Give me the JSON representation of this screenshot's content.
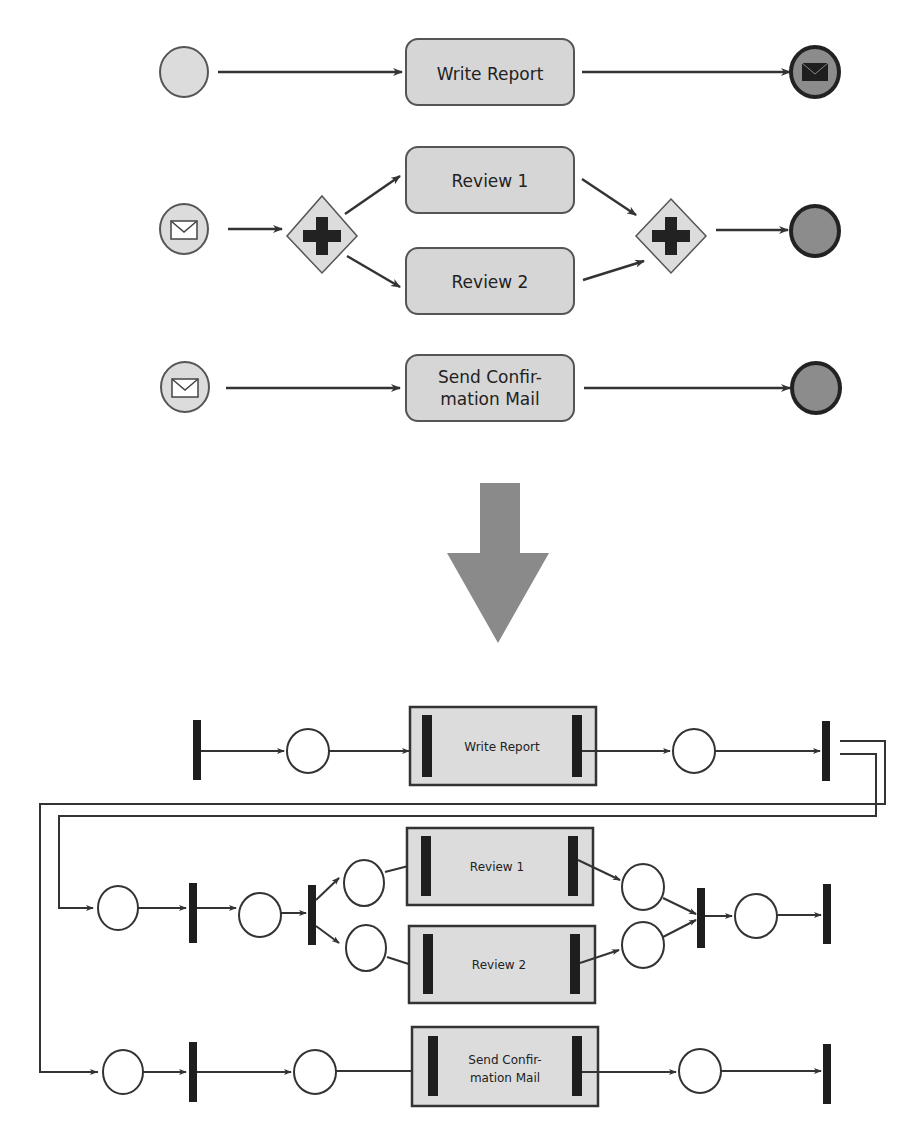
{
  "bpmn": {
    "tasks": {
      "write_report": "Write Report",
      "review1": "Review 1",
      "review2": "Review 2",
      "send_line1": "Send Confir-",
      "send_line2": "mation Mail"
    }
  },
  "petri": {
    "tasks": {
      "write_report": "Write Report",
      "review1": "Review 1",
      "review2": "Review 2",
      "send_line1": "Send Confir-",
      "send_line2": "mation Mail"
    }
  },
  "colors": {
    "task_fill": "#d6d6d6",
    "event_fill": "#dcdcdc",
    "end_fill": "#8c8c8c",
    "arrow_fill": "#8a8a8a",
    "transition": "#1e1e1e"
  }
}
